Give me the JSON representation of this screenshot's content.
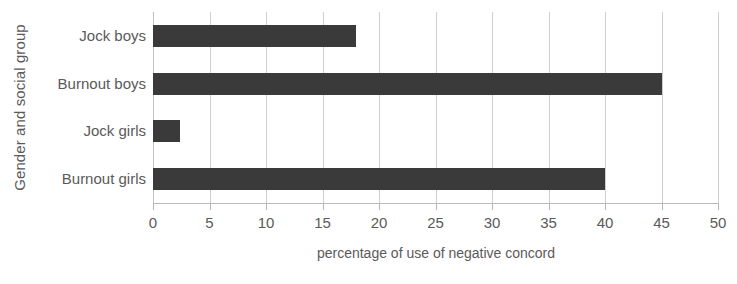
{
  "chart_data": {
    "type": "bar",
    "orientation": "horizontal",
    "title": "",
    "xlabel": "percentage of use of negative concord",
    "ylabel": "Gender and social group",
    "categories": [
      "Jock boys",
      "Burnout boys",
      "Jock girls",
      "Burnout girls"
    ],
    "values": [
      18,
      45,
      2.4,
      40
    ],
    "series": [
      {
        "name": "percentage of use of negative concord",
        "values": [
          18,
          45,
          2.4,
          40
        ]
      }
    ],
    "xlim": [
      0,
      50
    ],
    "xticks": [
      0,
      5,
      10,
      15,
      20,
      25,
      30,
      35,
      40,
      45,
      50
    ],
    "xtick_labels": [
      "0",
      "5",
      "10",
      "15",
      "20",
      "25",
      "30",
      "35",
      "40",
      "45",
      "50"
    ],
    "grid": "vertical",
    "legend": "none",
    "bar_color": "#3a3a3a",
    "grid_color": "#cfcfcf",
    "text_color": "#5a5a5a",
    "background_color": "#ffffff"
  }
}
